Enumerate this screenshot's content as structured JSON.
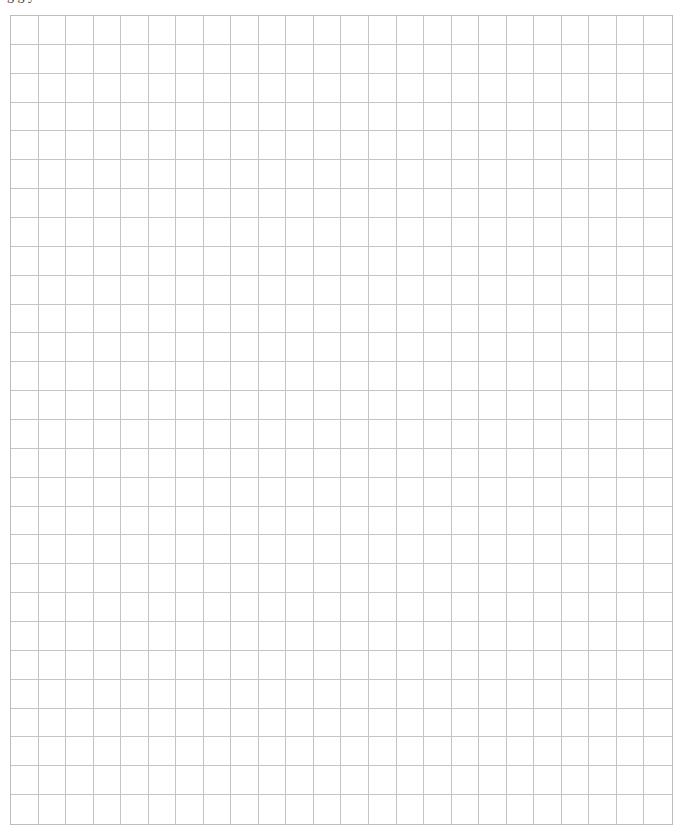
{
  "page": {
    "top_text": "ng                          g                                             y",
    "top_text_note_visible": "cut off; only descenders visible"
  },
  "grid": {
    "columns": 24,
    "rows": 28,
    "line_color": "#c4c4c4",
    "border_color": "#bdbdbd",
    "background": "#ffffff"
  }
}
